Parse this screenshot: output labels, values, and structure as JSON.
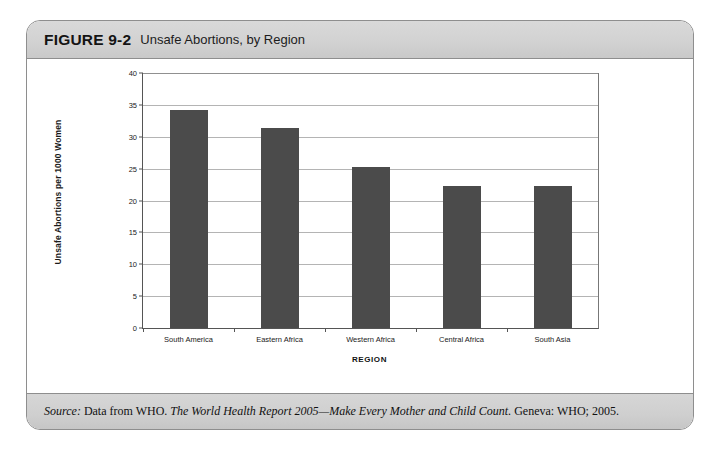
{
  "figure": {
    "number": "FIGURE 9-2",
    "caption": "Unsafe Abortions, by Region"
  },
  "source": {
    "label": "Source:",
    "lead": " Data from WHO. ",
    "title": "The World Health Report 2005—Make Every Mother and Child Count.",
    "tail": " Geneva: WHO; 2005."
  },
  "colors": {
    "bar": "#4b4b4b",
    "header_band": "#d2d2d2",
    "footer_band": "#cfcfcf",
    "card_border": "#8e8e8e",
    "gridline": "#b4b4b4"
  },
  "chart_data": {
    "type": "bar",
    "title": "Unsafe Abortions, by Region",
    "xlabel": "REGION",
    "ylabel": "Unsafe Abortions per 1000 Women",
    "categories": [
      "South America",
      "Eastern Africa",
      "Western Africa",
      "Central Africa",
      "South Asia"
    ],
    "values": [
      34.2,
      31.3,
      25.2,
      22.3,
      22.3
    ],
    "ylim": [
      0,
      40
    ],
    "yticks": [
      0,
      5,
      10,
      15,
      20,
      25,
      30,
      35,
      40
    ],
    "ytick_labels": [
      "0",
      "5",
      "10",
      "15",
      "20",
      "25",
      "30",
      "35",
      "40"
    ],
    "grid": true,
    "legend": false
  }
}
